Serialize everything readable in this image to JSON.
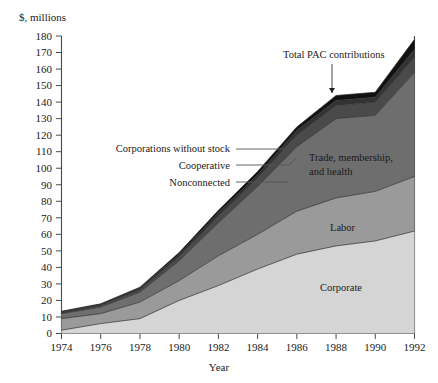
{
  "chart_data": {
    "type": "area",
    "title": "",
    "unit_label": "$, millions",
    "xlabel": "Year",
    "ylabel": "",
    "x": [
      1974,
      1976,
      1978,
      1980,
      1982,
      1984,
      1986,
      1988,
      1990,
      1992
    ],
    "categories": [
      "1974",
      "1976",
      "1978",
      "1980",
      "1982",
      "1984",
      "1986",
      "1988",
      "1990",
      "1992"
    ],
    "xticks": [
      "1974",
      "1976",
      "1978",
      "1980",
      "1982",
      "1984",
      "1986",
      "1988",
      "1990",
      "1992"
    ],
    "yticks": [
      "0",
      "10",
      "20",
      "30",
      "40",
      "50",
      "60",
      "70",
      "80",
      "90",
      "100",
      "110",
      "120",
      "130",
      "140",
      "150",
      "160",
      "170",
      "180"
    ],
    "xlim": [
      1974,
      1992
    ],
    "ylim": [
      0,
      180
    ],
    "grid": false,
    "legend_position": "none",
    "stacked": true,
    "series": [
      {
        "name": "Corporate",
        "color": "#d5d5d5",
        "values": [
          2,
          6,
          9,
          20,
          29,
          39,
          48,
          53,
          56,
          62
        ]
      },
      {
        "name": "Labor",
        "color": "#9a9a9a",
        "values": [
          9,
          12,
          19,
          32,
          47,
          60,
          74,
          82,
          86,
          95
        ]
      },
      {
        "name": "Trade, membership, and health",
        "color": "#6e6e6e",
        "values": [
          12,
          16,
          25,
          44,
          67,
          89,
          113,
          130,
          132,
          158
        ]
      },
      {
        "name": "Nonconnected",
        "color": "#4a4a4a",
        "values": [
          12.5,
          17,
          26.5,
          46.5,
          71,
          94,
          120,
          138,
          140,
          167
        ]
      },
      {
        "name": "Cooperative",
        "color": "#333333",
        "values": [
          13,
          17.5,
          27.5,
          48,
          73,
          96,
          123,
          141,
          143,
          172
        ]
      },
      {
        "name": "Corporations without stock",
        "color": "#111111",
        "values": [
          13.5,
          18,
          28,
          49,
          74.5,
          98,
          125,
          144,
          146,
          178
        ]
      }
    ],
    "band_labels": [
      {
        "text": "Corporate",
        "x": 320,
        "y": 291
      },
      {
        "text": "Labor",
        "x": 330,
        "y": 231
      },
      {
        "text": "Trade, membership,",
        "x": 309,
        "y": 161
      },
      {
        "text": "and health",
        "x": 309,
        "y": 175
      }
    ],
    "callouts": [
      {
        "text": "Corporations without stock",
        "label_x": 230,
        "label_y": 152,
        "line_x1": 236,
        "line_y1": 149,
        "line_x2": 284,
        "line_y2": 149,
        "line_x3": 292,
        "line_y3": 141
      },
      {
        "text": "Cooperative",
        "label_x": 230,
        "label_y": 169,
        "line_x1": 236,
        "line_y1": 165,
        "line_x2": 289,
        "line_y2": 165,
        "line_x3": 296,
        "line_y3": 158
      },
      {
        "text": "Nonconnected",
        "label_x": 230,
        "label_y": 186,
        "line_x1": 236,
        "line_y1": 182,
        "line_x2": 288,
        "line_y2": 182,
        "line_x3": 288,
        "line_y3": 182
      }
    ],
    "annotations": [
      {
        "text": "Total PAC contributions",
        "x": 283,
        "y": 58,
        "arrow_x": 332,
        "arrow_y1": 64,
        "arrow_y2": 93
      }
    ]
  }
}
